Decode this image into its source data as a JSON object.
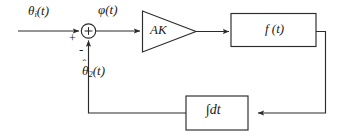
{
  "diagram": {
    "type": "control-system-block-diagram",
    "background_color": "#ffffff",
    "line_color": "#2b2b2b",
    "text_color": "#1a1a1a",
    "labels": {
      "input_signal": "θ",
      "input_signal_sub": "i",
      "input_signal_arg": "(t)",
      "error_signal": "φ(t)",
      "amplifier_gain": "AK",
      "plant_block": "f (t)",
      "feedback_signal": "θ",
      "feedback_signal_sub": "2",
      "feedback_signal_arg": "(t)",
      "feedback_signal_hat": "ˆ",
      "integrator_block": "∫dt"
    },
    "summing_junction": {
      "symbol": "+",
      "input_sign_left": "+",
      "input_sign_bottom": "-"
    },
    "blocks": [
      {
        "name": "amplifier",
        "shape": "triangle",
        "label": "AK"
      },
      {
        "name": "plant",
        "shape": "rectangle",
        "label": "f (t)"
      },
      {
        "name": "integrator",
        "shape": "rectangle",
        "label": "∫dt"
      }
    ],
    "signal_flow": [
      "θi(t) → summing junction (+)",
      "summing junction → φ(t) → AK amplifier",
      "AK amplifier → f (t) block",
      "f (t) → feedback path → ∫dt integrator",
      "∫dt → θ̂2(t) → summing junction (-)"
    ]
  }
}
